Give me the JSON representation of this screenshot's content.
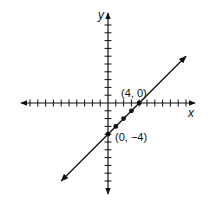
{
  "chart_data": {
    "type": "line",
    "title": "",
    "xlabel": "x",
    "ylabel": "y",
    "xlim": [
      -11,
      11
    ],
    "ylim": [
      -11,
      11
    ],
    "grid": false,
    "series": [
      {
        "name": "y = x - 4",
        "slope": 1,
        "intercept": -4,
        "x": [
          -6,
          10
        ],
        "y": [
          -10,
          6
        ]
      }
    ],
    "points": [
      {
        "x": 0,
        "y": -4,
        "label": "(0, −4)"
      },
      {
        "x": 1,
        "y": -3,
        "label": ""
      },
      {
        "x": 2,
        "y": -2,
        "label": ""
      },
      {
        "x": 3,
        "y": -1,
        "label": ""
      },
      {
        "x": 4,
        "y": 0,
        "label": "(4, 0)"
      }
    ],
    "annotations": [
      "(4, 0)",
      "(0, −4)"
    ]
  },
  "labels": {
    "x_axis": "x",
    "y_axis": "y",
    "point_a": "(4, 0)",
    "point_b": "(0, −4)"
  },
  "colors": {
    "ink": "#111111",
    "background": "#ffffff"
  }
}
